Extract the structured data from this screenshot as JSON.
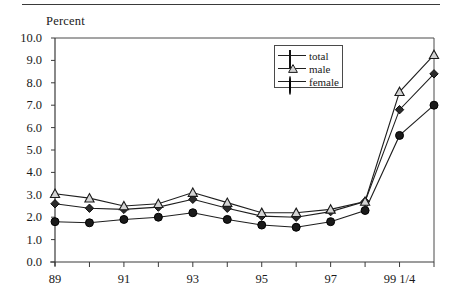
{
  "figure": {
    "unit_label": "Percent",
    "top_rule": true
  },
  "legend": {
    "position": "top-right-inside",
    "entries": [
      {
        "label": "total",
        "marker": "filled-diamond"
      },
      {
        "label": "male",
        "marker": "open-triangle"
      },
      {
        "label": "female",
        "marker": "filled-circle"
      }
    ]
  },
  "chart_data": {
    "type": "line",
    "title": "",
    "subtitle": "",
    "xlabel": "",
    "ylabel": "Percent",
    "ylim": [
      0.0,
      10.0
    ],
    "ytick_labels": [
      "0.0",
      "1.0",
      "2.0",
      "3.0",
      "4.0",
      "5.0",
      "6.0",
      "7.0",
      "8.0",
      "9.0",
      "10.0"
    ],
    "ytick_values": [
      0,
      1,
      2,
      3,
      4,
      5,
      6,
      7,
      8,
      9,
      10
    ],
    "grid": false,
    "x": [
      "89",
      "90",
      "91",
      "92",
      "93",
      "94",
      "95",
      "96",
      "97",
      "98",
      "99",
      "99 1/4"
    ],
    "xtick_labels_shown": [
      "89",
      "",
      "91",
      "",
      "93",
      "",
      "95",
      "",
      "97",
      "",
      "99 1/4",
      ""
    ],
    "categories": [
      "89",
      "90",
      "91",
      "92",
      "93",
      "94",
      "95",
      "96",
      "97",
      "98",
      "99",
      "99 1/4"
    ],
    "legend_position": "upper center-right",
    "series": [
      {
        "name": "total",
        "marker": "filled-diamond",
        "values": [
          2.6,
          2.4,
          2.35,
          2.45,
          2.8,
          2.4,
          2.05,
          2.0,
          2.25,
          2.7,
          6.8,
          8.4
        ]
      },
      {
        "name": "male",
        "marker": "open-triangle",
        "values": [
          3.05,
          2.85,
          2.5,
          2.6,
          3.1,
          2.65,
          2.2,
          2.2,
          2.35,
          2.7,
          7.6,
          9.25
        ]
      },
      {
        "name": "female",
        "marker": "filled-circle",
        "values": [
          1.8,
          1.75,
          1.9,
          2.0,
          2.2,
          1.9,
          1.65,
          1.55,
          1.8,
          2.3,
          5.65,
          7.0
        ]
      }
    ]
  }
}
